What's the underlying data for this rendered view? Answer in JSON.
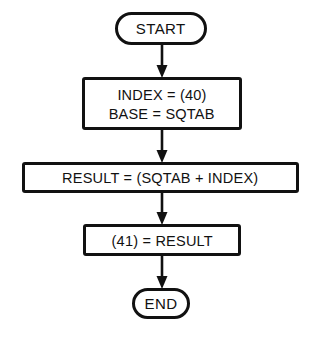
{
  "diagram": {
    "type": "flowchart",
    "background_color": "#ffffff",
    "stroke_color": "#111111",
    "nodes": [
      {
        "id": "start",
        "shape": "terminal",
        "lines": [
          "START"
        ]
      },
      {
        "id": "init",
        "shape": "process",
        "lines": [
          "INDEX = (40)",
          "BASE = SQTAB"
        ]
      },
      {
        "id": "result",
        "shape": "process",
        "lines": [
          "RESULT = (SQTAB + INDEX)"
        ]
      },
      {
        "id": "store",
        "shape": "process",
        "lines": [
          "(41) = RESULT"
        ]
      },
      {
        "id": "end",
        "shape": "terminal",
        "lines": [
          "END"
        ]
      }
    ],
    "edges": [
      {
        "from": "start",
        "to": "init",
        "arrow": "down"
      },
      {
        "from": "init",
        "to": "result",
        "arrow": "down"
      },
      {
        "from": "result",
        "to": "store",
        "arrow": "down"
      },
      {
        "from": "store",
        "to": "end",
        "arrow": "down"
      }
    ]
  }
}
